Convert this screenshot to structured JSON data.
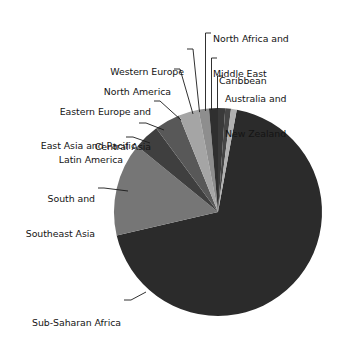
{
  "chart_data": {
    "type": "pie",
    "title": "",
    "subtitle": "",
    "xlabel": "",
    "ylabel": "",
    "legend_position": "none",
    "grid": false,
    "labels_as_callouts": true,
    "categories": [
      "Sub-Saharan Africa",
      "South and Southeast Asia",
      "Latin America",
      "East Asia and Pacific",
      "Eastern Europe and Central Asia",
      "North America",
      "Western Europe",
      "North Africa and Middle East",
      "Caribbean",
      "Australia and New Zealand"
    ],
    "values": [
      68.5,
      14.5,
      4.0,
      4.0,
      3.1,
      1.6,
      1.4,
      1.1,
      0.9,
      0.9
    ],
    "units": "percent",
    "slice_colors": [
      "#2b2b2b",
      "#767676",
      "#3f3f3f",
      "#585858",
      "#a5a5a5",
      "#8e8e8e",
      "#2f2f2f",
      "#3a3a3a",
      "#454545",
      "#b0b0b0"
    ],
    "slices": [
      {
        "label": "Sub-Saharan Africa",
        "value": 68.5,
        "color": "#2b2b2b",
        "start_deg": 193.0,
        "end_deg": 439.6
      },
      {
        "label": "South and Southeast Asia",
        "value": 14.5,
        "color": "#767676",
        "start_deg": 140.8,
        "end_deg": 193.0
      },
      {
        "label": "Latin America",
        "value": 4.0,
        "color": "#3f3f3f",
        "start_deg": 126.4,
        "end_deg": 140.8
      },
      {
        "label": "East Asia and Pacific",
        "value": 4.0,
        "color": "#585858",
        "start_deg": 112.0,
        "end_deg": 126.4
      },
      {
        "label": "Eastern Europe and Central Asia",
        "value": 3.1,
        "color": "#a5a5a5",
        "start_deg": 100.8,
        "end_deg": 112.0
      },
      {
        "label": "North America",
        "value": 1.6,
        "color": "#8e8e8e",
        "start_deg": 95.0,
        "end_deg": 100.8
      },
      {
        "label": "Western Europe",
        "value": 1.4,
        "color": "#2f2f2f",
        "start_deg": 90.0,
        "end_deg": 95.0
      },
      {
        "label": "North Africa and Middle East",
        "value": 1.1,
        "color": "#3a3a3a",
        "start_deg": 86.0,
        "end_deg": 90.0
      },
      {
        "label": "Caribbean",
        "value": 0.9,
        "color": "#454545",
        "start_deg": 82.8,
        "end_deg": 86.0
      },
      {
        "label": "Australia and New Zealand",
        "value": 0.9,
        "color": "#b0b0b0",
        "start_deg": 79.6,
        "end_deg": 82.8
      }
    ]
  },
  "geometry": {
    "center_x": 218,
    "center_y": 212,
    "radius": 104
  },
  "labels": {
    "north_africa_middle_east": {
      "line1": "North Africa and",
      "line2": "Middle East"
    },
    "caribbean": {
      "line1": "Caribbean",
      "line2": ""
    },
    "australia_new_zealand": {
      "line1": "Australia and",
      "line2": "New Zealand"
    },
    "western_europe": {
      "line1": "Western Europe",
      "line2": ""
    },
    "north_america": {
      "line1": "North America",
      "line2": ""
    },
    "eastern_europe_central_asia": {
      "line1": "Eastern Europe and",
      "line2": "Central Asia"
    },
    "east_asia_pacific": {
      "line1": "East Asia and Pacific",
      "line2": ""
    },
    "latin_america": {
      "line1": "Latin America",
      "line2": ""
    },
    "south_southeast_asia": {
      "line1": "South and",
      "line2": "Southeast Asia"
    },
    "sub_saharan_africa": {
      "line1": "Sub-Saharan Africa",
      "line2": ""
    }
  },
  "colors": {
    "background": "#ffffff",
    "text": "#141414",
    "leader_line": "#1a1a1a"
  }
}
